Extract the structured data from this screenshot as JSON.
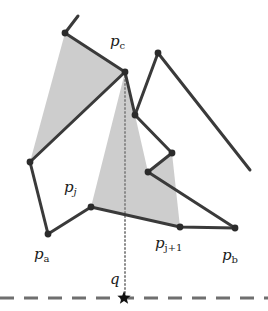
{
  "figure": {
    "width": 268,
    "height": 311,
    "background_color": "#ffffff"
  },
  "colors": {
    "stroke": "#3a3a3a",
    "vertex_dot": "#2b2b2b",
    "shade_fill": "#c9c9c9",
    "dotted_line": "#8a8a8a",
    "dashed_ground": "#6f6f6f",
    "label_text": "#1a1a1a"
  },
  "labels": [
    {
      "name": "label-pc",
      "base": "p",
      "sub": "c",
      "sub_style": "upright",
      "x": 110,
      "y": 34
    },
    {
      "name": "label-pj",
      "base": "p",
      "sub": "j",
      "sub_style": "italic",
      "x": 64,
      "y": 180
    },
    {
      "name": "label-pj1",
      "base": "p",
      "sub": "j+1",
      "sub_style": "upright",
      "x": 155,
      "y": 236
    },
    {
      "name": "label-pa",
      "base": "p",
      "sub": "a",
      "sub_style": "upright",
      "x": 34,
      "y": 247
    },
    {
      "name": "label-pb",
      "base": "p",
      "sub": "b",
      "sub_style": "upright",
      "x": 222,
      "y": 248
    },
    {
      "name": "label-q",
      "base": "q",
      "sub": "",
      "sub_style": "italic",
      "x": 110,
      "y": 272
    }
  ],
  "geometry": {
    "shaded_regions": [
      {
        "name": "left-shaded-triangle",
        "points": "65,33 125,72 30,162"
      },
      {
        "name": "visibility-fan-region",
        "points": "125,72 91,207 180,227 172,153 148,172 135,115"
      }
    ],
    "chain_upper_left": {
      "name": "chain-upper-left",
      "points": "78,16 65,33 125,72"
    },
    "chain_left_lower": {
      "name": "chain-left-lower",
      "points": "125,72 30,162 48,234 91,207"
    },
    "chain_bottom": {
      "name": "chain-bottom",
      "points": "91,207 180,227 235,228"
    },
    "chain_right_zigzag": {
      "name": "chain-right-zigzag",
      "points": "125,72 135,115 158,53 250,170"
    },
    "chain_zigzag_inner": {
      "name": "chain-zigzag-inner",
      "points": "135,115 172,153 148,172 235,228"
    },
    "dotted_vertical": {
      "name": "dotted-projection-line",
      "x": 125,
      "y1": 72,
      "y2": 295
    },
    "dashed_ground_line": {
      "name": "dashed-ground-line",
      "x1": 0,
      "x2": 268,
      "y": 298
    },
    "query_point_star": {
      "name": "query-point-star",
      "x": 124,
      "y": 298,
      "radius": 7
    },
    "vertices": [
      {
        "name": "vertex-chain-top",
        "x": 65,
        "y": 33
      },
      {
        "name": "vertex-pc",
        "x": 125,
        "y": 72
      },
      {
        "name": "vertex-right-peak",
        "x": 158,
        "y": 53
      },
      {
        "name": "vertex-zigzag-a",
        "x": 135,
        "y": 115
      },
      {
        "name": "vertex-zigzag-b",
        "x": 172,
        "y": 153
      },
      {
        "name": "vertex-zigzag-c",
        "x": 148,
        "y": 172
      },
      {
        "name": "vertex-left-mid",
        "x": 30,
        "y": 162
      },
      {
        "name": "vertex-pa",
        "x": 48,
        "y": 234
      },
      {
        "name": "vertex-pj",
        "x": 91,
        "y": 207
      },
      {
        "name": "vertex-pj1",
        "x": 180,
        "y": 227
      },
      {
        "name": "vertex-pb",
        "x": 235,
        "y": 228
      }
    ]
  }
}
